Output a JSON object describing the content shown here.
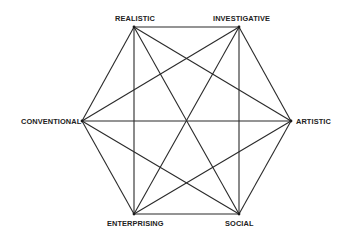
{
  "diagram": {
    "type": "hexagon-complete-graph",
    "title": "",
    "nodes": [
      {
        "id": "R",
        "label": "REALISTIC",
        "x": 134,
        "y": 27,
        "lx": 115,
        "ly": 21,
        "anchor": "start"
      },
      {
        "id": "I",
        "label": "INVESTIGATIVE",
        "x": 239,
        "y": 27,
        "lx": 213,
        "ly": 21,
        "anchor": "start"
      },
      {
        "id": "A",
        "label": "ARTISTIC",
        "x": 291,
        "y": 121,
        "lx": 296,
        "ly": 124,
        "anchor": "start"
      },
      {
        "id": "S",
        "label": "SOCIAL",
        "x": 239,
        "y": 214,
        "lx": 225,
        "ly": 226,
        "anchor": "start"
      },
      {
        "id": "E",
        "label": "ENTERPRISING",
        "x": 134,
        "y": 214,
        "lx": 107,
        "ly": 226,
        "anchor": "start"
      },
      {
        "id": "C",
        "label": "CONVENTIONAL",
        "x": 82,
        "y": 121,
        "lx": 21,
        "ly": 124,
        "anchor": "start"
      }
    ],
    "edges": [
      [
        "R",
        "I"
      ],
      [
        "R",
        "A"
      ],
      [
        "R",
        "S"
      ],
      [
        "R",
        "E"
      ],
      [
        "R",
        "C"
      ],
      [
        "I",
        "A"
      ],
      [
        "I",
        "S"
      ],
      [
        "I",
        "E"
      ],
      [
        "I",
        "C"
      ],
      [
        "A",
        "S"
      ],
      [
        "A",
        "E"
      ],
      [
        "A",
        "C"
      ],
      [
        "S",
        "E"
      ],
      [
        "S",
        "C"
      ],
      [
        "E",
        "C"
      ]
    ],
    "colors": {
      "line": "#2a2a2a",
      "text": "#222222",
      "background": "#ffffff"
    }
  }
}
